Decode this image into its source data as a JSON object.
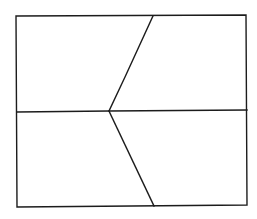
{
  "diagram": {
    "type": "line-drawing",
    "stroke_color": "#1c1c1c",
    "background_color": "#ffffff",
    "outer_rectangle": {
      "points": [
        [
          16,
          16
        ],
        [
          246,
          15
        ],
        [
          247,
          205
        ],
        [
          17,
          207
        ]
      ]
    },
    "horizontal_line": {
      "points": [
        [
          17,
          112
        ],
        [
          109,
          111
        ],
        [
          247,
          110
        ]
      ]
    },
    "upper_diagonal": {
      "points": [
        [
          153,
          16
        ],
        [
          125,
          77
        ],
        [
          109,
          111
        ]
      ]
    },
    "lower_diagonal": {
      "points": [
        [
          109,
          111
        ],
        [
          154,
          206
        ]
      ]
    },
    "junction_point": [
      109,
      111
    ],
    "regions": [
      {
        "name": "upper-left"
      },
      {
        "name": "upper-right"
      },
      {
        "name": "lower-left"
      },
      {
        "name": "lower-right"
      }
    ]
  }
}
